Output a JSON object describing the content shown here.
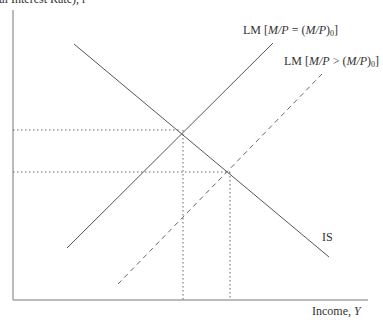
{
  "diagram": {
    "type": "IS-LM",
    "y_axis_label": "(Real Interest Rate), r",
    "x_axis_label_text": "Income, ",
    "x_axis_label_var": "Y",
    "curves": [
      {
        "name": "IS",
        "label": "IS",
        "style": "solid",
        "from": [
          74,
          44
        ],
        "to": [
          329,
          257
        ]
      },
      {
        "name": "LM0",
        "label_prefix": "LM [",
        "label_var": "M/P",
        "label_op": " = (",
        "label_var2": "M/P",
        "label_close": ")",
        "label_sub": "0",
        "label_end": "]",
        "style": "solid",
        "from": [
          67,
          248
        ],
        "to": [
          273,
          43
        ]
      },
      {
        "name": "LM1",
        "label_prefix": "LM [",
        "label_var": "M/P",
        "label_op": " > (",
        "label_var2": "M/P",
        "label_close": ")",
        "label_sub": "0",
        "label_end": "]",
        "style": "dashed",
        "from": [
          118,
          284
        ],
        "to": [
          322,
          74
        ]
      }
    ],
    "equilibria": [
      {
        "x": 181,
        "y": 130
      },
      {
        "x": 230,
        "y": 172
      }
    ],
    "colors": {
      "line": "#555555",
      "axis": "#777777",
      "dotted": "#666666"
    }
  }
}
